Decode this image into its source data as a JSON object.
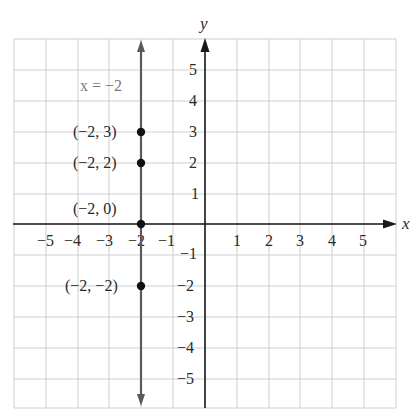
{
  "chart_data": {
    "type": "line",
    "title": "",
    "xlabel": "x",
    "ylabel": "y",
    "xlim": [
      -6,
      6
    ],
    "ylim": [
      -6,
      6
    ],
    "grid": true,
    "x_ticks": [
      -5,
      -4,
      -3,
      -2,
      -1,
      1,
      2,
      3,
      4,
      5
    ],
    "y_ticks": [
      5,
      4,
      3,
      2,
      1,
      -1,
      -2,
      -3,
      -4,
      -5
    ],
    "x_tick_labels": [
      "−5",
      "−4",
      "−3",
      "−2",
      "−1",
      "1",
      "2",
      "3",
      "4",
      "5"
    ],
    "y_tick_labels": [
      "5",
      "4",
      "3",
      "2",
      "1",
      "−1",
      "−2",
      "−3",
      "−4",
      "−5"
    ],
    "series": [
      {
        "name": "x = −2",
        "kind": "vertical-line",
        "x": -2,
        "color": "#5a5a5a",
        "label_text": "x = −2"
      }
    ],
    "points": [
      {
        "x": -2,
        "y": 3,
        "label": "(−2, 3)"
      },
      {
        "x": -2,
        "y": 2,
        "label": "(−2, 2)"
      },
      {
        "x": -2,
        "y": 0,
        "label": "(−2, 0)"
      },
      {
        "x": -2,
        "y": -2,
        "label": "(−2, −2)"
      }
    ],
    "colors": {
      "grid": "#cfcfcf",
      "axis": "#1a1a1a",
      "line": "#5a5a5a",
      "point": "#111111",
      "equation_label": "#7a7a7a"
    }
  },
  "labels": {
    "x_axis": "x",
    "y_axis": "y",
    "equation": "x = −2",
    "point_0": "(−2, 3)",
    "point_1": "(−2, 2)",
    "point_2": "(−2, 0)",
    "point_3": "(−2, −2)",
    "xt": [
      "−5",
      "−4",
      "−3",
      "−2",
      "−1",
      "1",
      "2",
      "3",
      "4",
      "5"
    ],
    "yt": [
      "5",
      "4",
      "3",
      "2",
      "1",
      "−1",
      "−2",
      "−3",
      "−4",
      "−5"
    ]
  }
}
